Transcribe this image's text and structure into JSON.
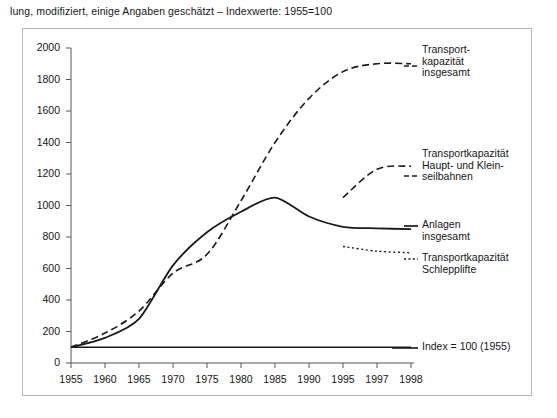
{
  "caption": "lung, modifiziert, einige Angaben geschätzt – Indexwerte: 1955=100",
  "chart_data": {
    "type": "line",
    "title": "",
    "xlabel": "",
    "ylabel": "",
    "categories": [
      "1955",
      "1960",
      "1965",
      "1970",
      "1975",
      "1980",
      "1985",
      "1990",
      "1995",
      "1997",
      "1998"
    ],
    "ylim": [
      0,
      2000
    ],
    "yticks": [
      0,
      200,
      400,
      600,
      800,
      1000,
      1200,
      1400,
      1600,
      1800,
      2000
    ],
    "grid": false,
    "legend_position": "right-inline",
    "series": [
      {
        "name": "Transportkapazität insgesamt",
        "style": "dashed",
        "label_text": "Transport-\nkapazität\ninsgesamt",
        "x": [
          "1955",
          "1960",
          "1965",
          "1970",
          "1975",
          "1980",
          "1985",
          "1990",
          "1995",
          "1997",
          "1998"
        ],
        "values": [
          100,
          190,
          330,
          570,
          690,
          1030,
          1400,
          1680,
          1850,
          1900,
          1900
        ]
      },
      {
        "name": "Anlagen insgesamt",
        "style": "solid",
        "label_text": "Anlagen\ninsgesamt",
        "x": [
          "1955",
          "1960",
          "1965",
          "1970",
          "1975",
          "1980",
          "1985",
          "1990",
          "1995",
          "1997",
          "1998"
        ],
        "values": [
          100,
          160,
          280,
          620,
          830,
          960,
          1050,
          930,
          865,
          855,
          850
        ]
      },
      {
        "name": "Transportkapazität Haupt- und Kleinseilbahnen",
        "style": "dashed",
        "label_text": "Transportkapazität\nHaupt- und Klein-\nseilbahnen",
        "x": [
          "1995",
          "1997",
          "1998"
        ],
        "values": [
          1050,
          1230,
          1250
        ]
      },
      {
        "name": "Transportkapazität Schlepplifte",
        "style": "dotted",
        "label_text": "Transportkapazität\nSchlepplifte",
        "x": [
          "1995",
          "1997",
          "1998"
        ],
        "values": [
          740,
          710,
          700
        ]
      },
      {
        "name": "Index = 100 (1955)",
        "style": "solid-baseline",
        "label_text": "Index = 100 (1955)",
        "x": [
          "1955",
          "1960",
          "1965",
          "1970",
          "1975",
          "1980",
          "1985",
          "1990",
          "1995",
          "1997",
          "1998"
        ],
        "values": [
          100,
          100,
          100,
          100,
          100,
          100,
          100,
          100,
          100,
          100,
          100
        ]
      }
    ],
    "annotations": [
      {
        "text": "Transport-\nkapazität\ninsgesamt",
        "series": "Transportkapazität insgesamt"
      },
      {
        "text": "Transportkapazität\nHaupt- und Klein-\nseilbahnen",
        "series": "Transportkapazität Haupt- und Kleinseilbahnen"
      },
      {
        "text": "Anlagen\ninsgesamt",
        "series": "Anlagen insgesamt"
      },
      {
        "text": "Transportkapazität\nSchlepplifte",
        "series": "Transportkapazität Schlepplifte"
      },
      {
        "text": "Index = 100 (1955)",
        "series": "Index = 100 (1955)"
      }
    ]
  },
  "colors": {
    "line": "#1a1a1a",
    "axis": "#555555",
    "frame": "#b9b9b9",
    "background": "#ffffff"
  }
}
